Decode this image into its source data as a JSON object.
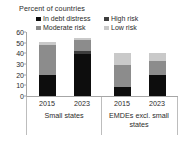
{
  "chart_data": {
    "type": "bar",
    "title": "Percent of countries",
    "subtitle": "",
    "xlabel": "",
    "ylabel": "",
    "stacked": true,
    "grid": false,
    "legend_position": "top",
    "ylim": [
      0,
      60
    ],
    "yticks": [
      0,
      10,
      20,
      30,
      40,
      50,
      60
    ],
    "ytick_labels": [
      "0",
      "10",
      "20",
      "30",
      "40",
      "50",
      "60"
    ],
    "categories": [
      "2015",
      "2023",
      "2015",
      "2023"
    ],
    "groups": [
      {
        "label": "Small states",
        "categories": [
          "2015",
          "2023"
        ]
      },
      {
        "label": "EMDEs excl. small states",
        "categories": [
          "2015",
          "2023"
        ]
      }
    ],
    "series": [
      {
        "name": "In debt distress",
        "color": "#0d0d0d",
        "values": [
          20,
          39,
          8,
          20
        ]
      },
      {
        "name": "High risk",
        "color": "#3d3d3d",
        "values": [
          0,
          3,
          0,
          0
        ]
      },
      {
        "name": "Moderate risk",
        "color": "#8c8c8c",
        "values": [
          28,
          11,
          21,
          13
        ]
      },
      {
        "name": "Low risk",
        "color": "#c9c9c9",
        "values": [
          3,
          1,
          11,
          7
        ]
      }
    ],
    "legend": [
      {
        "label": "In debt distress",
        "color": "#0d0d0d"
      },
      {
        "label": "High risk",
        "color": "#3d3d3d"
      },
      {
        "label": "Moderate risk",
        "color": "#8c8c8c"
      },
      {
        "label": "Low risk",
        "color": "#c9c9c9"
      }
    ],
    "bar_totals": [
      51,
      54,
      40,
      40
    ]
  }
}
